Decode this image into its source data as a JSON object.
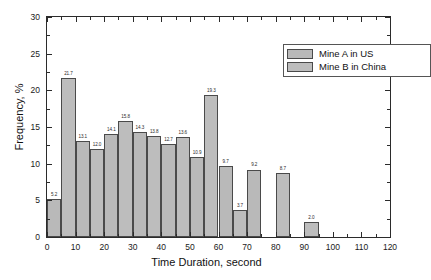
{
  "chart_data": {
    "type": "bar",
    "title": "",
    "xlabel": "Time Duration, second",
    "ylabel": "Frequency, %",
    "xlim": [
      0,
      120
    ],
    "ylim": [
      0,
      30
    ],
    "xticks": [
      "0",
      "10",
      "20",
      "30",
      "40",
      "50",
      "60",
      "70",
      "80",
      "90",
      "100",
      "110",
      "120"
    ],
    "yticks": [
      "0",
      "5",
      "10",
      "15",
      "20",
      "25",
      "30"
    ],
    "grid": false,
    "legend_position": "top-right",
    "bin_width": 5,
    "series": [
      {
        "name": "Mine A in US",
        "color": "#b9b9b9",
        "bins": [
          {
            "x0": 0,
            "x1": 5,
            "value": 5.2,
            "label": "5.2"
          },
          {
            "x0": 10,
            "x1": 15,
            "value": 13.1,
            "label": "13.1"
          },
          {
            "x0": 20,
            "x1": 25,
            "value": 14.1,
            "label": "14.1"
          },
          {
            "x0": 30,
            "x1": 35,
            "value": 14.3,
            "label": "14.3"
          },
          {
            "x0": 40,
            "x1": 45,
            "value": 12.7,
            "label": "12.7"
          },
          {
            "x0": 50,
            "x1": 55,
            "value": 10.9,
            "label": "10.9"
          },
          {
            "x0": 60,
            "x1": 65,
            "value": 9.7,
            "label": "9.7"
          },
          {
            "x0": 70,
            "x1": 75,
            "value": 9.2,
            "label": "9.2"
          }
        ]
      },
      {
        "name": "Mine B in China",
        "color": "#bdbdbd",
        "bins": [
          {
            "x0": 5,
            "x1": 10,
            "value": 21.7,
            "label": "21.7"
          },
          {
            "x0": 15,
            "x1": 20,
            "value": 12.0,
            "label": "12.0"
          },
          {
            "x0": 25,
            "x1": 30,
            "value": 15.8,
            "label": "15.8"
          },
          {
            "x0": 35,
            "x1": 40,
            "value": 13.8,
            "label": "13.8"
          },
          {
            "x0": 45,
            "x1": 50,
            "value": 13.6,
            "label": "13.6"
          },
          {
            "x0": 55,
            "x1": 60,
            "value": 19.3,
            "label": "19.3"
          },
          {
            "x0": 65,
            "x1": 70,
            "value": 3.7,
            "label": "3.7"
          },
          {
            "x0": 80,
            "x1": 85,
            "value": 8.7,
            "label": "8.7"
          },
          {
            "x0": 90,
            "x1": 95,
            "value": 2.0,
            "label": "2.0"
          }
        ]
      }
    ]
  },
  "legend": {
    "entries": [
      {
        "label": "Mine A in US"
      },
      {
        "label": "Mine B in China"
      }
    ]
  }
}
